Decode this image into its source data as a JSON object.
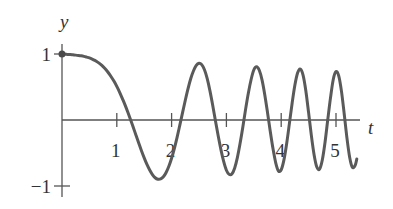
{
  "chart_data": {
    "type": "line",
    "title": "",
    "xlabel": "t",
    "ylabel": "y",
    "xlim": [
      0,
      5.38
    ],
    "ylim": [
      -1,
      1
    ],
    "grid": false,
    "legend": "none",
    "x_ticks": [
      {
        "value": 1,
        "label": "1"
      },
      {
        "value": 2,
        "label": "2"
      },
      {
        "value": 3,
        "label": "3"
      },
      {
        "value": 4,
        "label": "4"
      },
      {
        "value": 5,
        "label": "5"
      }
    ],
    "y_ticks": [
      {
        "value": 1,
        "label": "1"
      },
      {
        "value": -1,
        "label": "−1"
      }
    ],
    "start_point": {
      "t": 0,
      "y": 1
    },
    "series": [
      {
        "name": "y(t)",
        "color": "#5a5a5a",
        "t": [
          0,
          0.05,
          0.1,
          0.15,
          0.2,
          0.25,
          0.3,
          0.35,
          0.4,
          0.45,
          0.5,
          0.55,
          0.6,
          0.65,
          0.7,
          0.75,
          0.8,
          0.85,
          0.9,
          0.95,
          1.0,
          1.05,
          1.1,
          1.15,
          1.2,
          1.25,
          1.3,
          1.35,
          1.4,
          1.45,
          1.5,
          1.55,
          1.6,
          1.65,
          1.7,
          1.75,
          1.8,
          1.85,
          1.9,
          1.95,
          2.0,
          2.05,
          2.1,
          2.15,
          2.2,
          2.25,
          2.3,
          2.35,
          2.4,
          2.45,
          2.5,
          2.55,
          2.6,
          2.65,
          2.7,
          2.75,
          2.8,
          2.85,
          2.9,
          2.95,
          3.0,
          3.05,
          3.1,
          3.15,
          3.2,
          3.25,
          3.3,
          3.35,
          3.4,
          3.45,
          3.5,
          3.55,
          3.6,
          3.65,
          3.7,
          3.75,
          3.8,
          3.85,
          3.9,
          3.95,
          4.0,
          4.05,
          4.1,
          4.15,
          4.2,
          4.25,
          4.3,
          4.35,
          4.4,
          4.45,
          4.5,
          4.55,
          4.6,
          4.65,
          4.7,
          4.75,
          4.8,
          4.85,
          4.9,
          4.95,
          5.0,
          5.05,
          5.1,
          5.15,
          5.2,
          5.25,
          5.3,
          5.35,
          5.38
        ],
        "y": [
          1.0,
          0.997,
          0.994,
          0.991,
          0.987,
          0.983,
          0.978,
          0.972,
          0.964,
          0.953,
          0.941,
          0.924,
          0.903,
          0.877,
          0.846,
          0.809,
          0.764,
          0.712,
          0.652,
          0.586,
          0.509,
          0.424,
          0.328,
          0.229,
          0.121,
          0.008,
          -0.11,
          -0.23,
          -0.349,
          -0.466,
          -0.574,
          -0.674,
          -0.758,
          -0.827,
          -0.875,
          -0.897,
          -0.893,
          -0.861,
          -0.796,
          -0.701,
          -0.58,
          -0.433,
          -0.264,
          -0.078,
          0.111,
          0.3,
          0.476,
          0.628,
          0.746,
          0.828,
          0.86,
          0.839,
          0.762,
          0.627,
          0.442,
          0.224,
          -0.01,
          -0.24,
          -0.449,
          -0.628,
          -0.761,
          -0.824,
          -0.818,
          -0.731,
          -0.57,
          -0.354,
          -0.107,
          0.161,
          0.406,
          0.61,
          0.757,
          0.807,
          0.754,
          0.608,
          0.384,
          0.115,
          -0.17,
          -0.433,
          -0.648,
          -0.772,
          -0.754,
          -0.605,
          -0.356,
          -0.051,
          0.258,
          0.529,
          0.715,
          0.77,
          0.677,
          0.44,
          0.111,
          -0.233,
          -0.525,
          -0.713,
          -0.744,
          -0.607,
          -0.338,
          0.007,
          0.339,
          0.614,
          0.734,
          0.669,
          0.434,
          0.091,
          -0.274,
          -0.567,
          -0.718,
          -0.685,
          -0.59
        ]
      }
    ]
  }
}
